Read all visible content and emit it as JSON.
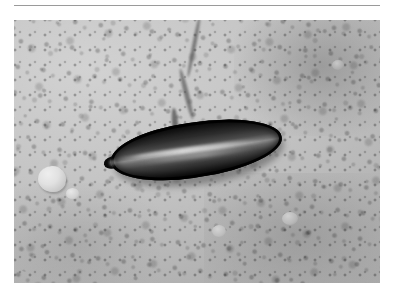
{
  "page": {
    "background_color": "#ffffff",
    "width": 394,
    "height": 295
  },
  "rule": {
    "name": "horizontal-rule",
    "color": "#9a9a9a",
    "thickness_px": 1
  },
  "photo": {
    "caption": "",
    "alt_text": "Grayscale close-up photograph of a dark elongated pod-shaped object resting on coarse light-gray gravel",
    "mode": "grayscale",
    "frame": {
      "left": 14,
      "top": 20,
      "width": 366,
      "height": 263
    },
    "background": {
      "name": "gravel-bed",
      "description": "coarse granular gravel and sand texture",
      "base_color": "#c2c2c2",
      "light_color": "#d2d2d2",
      "dark_color": "#a0a0a0"
    },
    "features": [
      {
        "name": "dark-crack",
        "description": "dark diagonal crack running from the top edge down toward the specimen"
      },
      {
        "name": "light-pebble",
        "description": "pale rounded pebble in the lower-left quadrant",
        "color": "#e1e1e1"
      },
      {
        "name": "specimen",
        "description": "dark elongated pod with a bright lengthwise highlight stripe and a pointed left tip",
        "outline_color": "#0c0c0c",
        "highlight_color": "#e1e1e1",
        "rotation_deg": -8.5
      }
    ]
  }
}
